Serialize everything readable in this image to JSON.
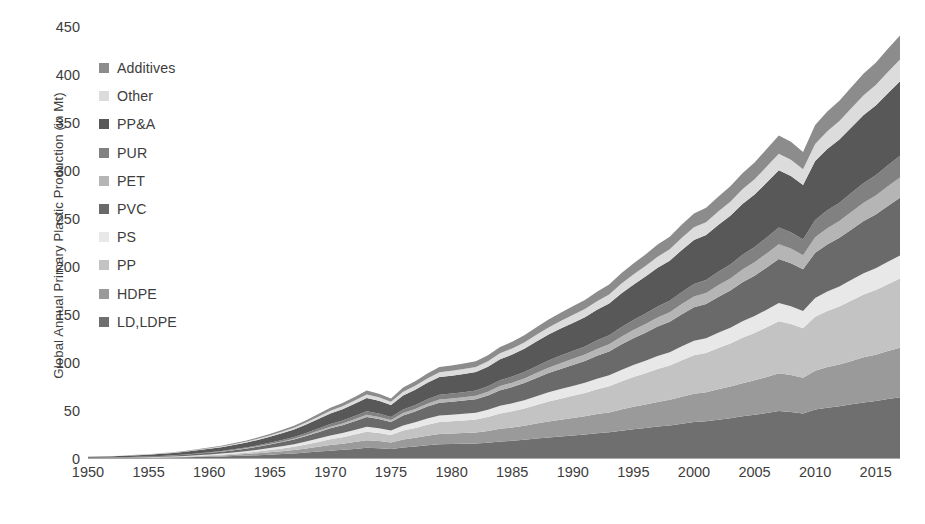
{
  "chart_data": {
    "type": "area",
    "stacked": true,
    "title": "",
    "xlabel": "",
    "ylabel": "Global Annual Primary Plastic Production (in Mt)",
    "ylim": [
      0,
      450
    ],
    "xlim": [
      1950,
      2017
    ],
    "y_ticks": [
      0,
      50,
      100,
      150,
      200,
      250,
      300,
      350,
      400,
      450
    ],
    "x_ticks": [
      1950,
      1955,
      1960,
      1965,
      1970,
      1975,
      1980,
      1985,
      1990,
      1995,
      2000,
      2005,
      2010,
      2015
    ],
    "grid": false,
    "legend_position": "inside-top-left",
    "x": [
      1950,
      1951,
      1952,
      1953,
      1954,
      1955,
      1956,
      1957,
      1958,
      1959,
      1960,
      1961,
      1962,
      1963,
      1964,
      1965,
      1966,
      1967,
      1968,
      1969,
      1970,
      1971,
      1972,
      1973,
      1974,
      1975,
      1976,
      1977,
      1978,
      1979,
      1980,
      1981,
      1982,
      1983,
      1984,
      1985,
      1986,
      1987,
      1988,
      1989,
      1990,
      1991,
      1992,
      1993,
      1994,
      1995,
      1996,
      1997,
      1998,
      1999,
      2000,
      2001,
      2002,
      2003,
      2004,
      2005,
      2006,
      2007,
      2008,
      2009,
      2010,
      2011,
      2012,
      2013,
      2014,
      2015,
      2016,
      2017
    ],
    "series": [
      {
        "name": "LD,LDPE",
        "color": "#6f6f6f",
        "stack_order": 1,
        "values": [
          0.3,
          0.4,
          0.4,
          0.5,
          0.6,
          0.7,
          0.9,
          1.0,
          1.2,
          1.5,
          1.8,
          2.1,
          2.5,
          2.9,
          3.4,
          4.0,
          4.6,
          5.3,
          6.2,
          7.2,
          8.2,
          9.0,
          10.0,
          11.1,
          10.6,
          9.8,
          11.5,
          12.5,
          13.8,
          14.8,
          15.0,
          15.3,
          15.6,
          16.5,
          17.8,
          18.5,
          19.5,
          20.8,
          22.0,
          23.0,
          24.0,
          25.0,
          26.3,
          27.3,
          29.0,
          30.5,
          31.8,
          33.3,
          34.5,
          36.3,
          38.0,
          38.8,
          40.5,
          42.0,
          44.0,
          45.5,
          47.5,
          49.5,
          48.5,
          47.0,
          51.0,
          53.0,
          54.5,
          56.5,
          58.5,
          60.0,
          62.0,
          64.0
        ]
      },
      {
        "name": "HDPE",
        "color": "#9a9a9a",
        "stack_order": 2,
        "values": [
          0.05,
          0.05,
          0.08,
          0.1,
          0.15,
          0.2,
          0.3,
          0.4,
          0.5,
          0.7,
          0.9,
          1.1,
          1.4,
          1.7,
          2.1,
          2.5,
          3.0,
          3.5,
          4.2,
          5.0,
          5.8,
          6.4,
          7.2,
          8.0,
          7.6,
          7.0,
          8.3,
          9.1,
          10.0,
          10.8,
          11.0,
          11.2,
          11.5,
          12.2,
          13.2,
          13.8,
          14.6,
          15.6,
          16.6,
          17.4,
          18.2,
          19.0,
          20.0,
          20.8,
          22.2,
          23.4,
          24.5,
          25.7,
          26.7,
          28.2,
          29.6,
          30.3,
          31.7,
          33.0,
          34.6,
          36.0,
          37.6,
          39.3,
          38.5,
          37.3,
          40.6,
          42.3,
          43.6,
          45.3,
          47.0,
          48.3,
          50.0,
          51.6
        ]
      },
      {
        "name": "PP",
        "color": "#c3c3c3",
        "stack_order": 3,
        "values": [
          0.0,
          0.0,
          0.0,
          0.0,
          0.02,
          0.05,
          0.1,
          0.2,
          0.3,
          0.45,
          0.6,
          0.8,
          1.1,
          1.4,
          1.8,
          2.3,
          2.8,
          3.4,
          4.2,
          5.1,
          6.0,
          6.8,
          7.8,
          8.8,
          8.4,
          7.8,
          9.3,
          10.3,
          11.5,
          12.5,
          12.8,
          13.2,
          13.6,
          14.6,
          16.0,
          16.9,
          18.0,
          19.4,
          20.8,
          22.0,
          23.2,
          24.4,
          25.9,
          27.2,
          29.2,
          31.0,
          32.6,
          34.4,
          35.8,
          38.0,
          40.0,
          41.0,
          43.1,
          45.0,
          47.4,
          49.4,
          51.8,
          54.3,
          53.2,
          51.5,
          56.2,
          58.6,
          60.5,
          63.0,
          65.5,
          67.4,
          69.8,
          72.0
        ]
      },
      {
        "name": "PS",
        "color": "#e8e8e8",
        "stack_order": 4,
        "values": [
          0.15,
          0.18,
          0.2,
          0.25,
          0.3,
          0.35,
          0.45,
          0.55,
          0.65,
          0.8,
          0.95,
          1.1,
          1.3,
          1.5,
          1.8,
          2.1,
          2.4,
          2.7,
          3.2,
          3.6,
          4.1,
          4.4,
          4.8,
          5.3,
          5.0,
          4.6,
          5.4,
          5.8,
          6.4,
          6.8,
          6.9,
          7.0,
          7.1,
          7.5,
          8.0,
          8.3,
          8.7,
          9.2,
          9.6,
          10.0,
          10.3,
          10.6,
          11.0,
          11.4,
          12.0,
          12.5,
          13.0,
          13.5,
          13.9,
          14.5,
          15.1,
          15.3,
          15.9,
          16.4,
          17.1,
          17.6,
          18.3,
          19.0,
          18.6,
          18.0,
          19.5,
          20.2,
          20.8,
          21.5,
          22.2,
          22.8,
          23.5,
          24.2
        ]
      },
      {
        "name": "PVC",
        "color": "#6a6a6a",
        "stack_order": 5,
        "values": [
          0.3,
          0.35,
          0.4,
          0.5,
          0.6,
          0.7,
          0.85,
          1.0,
          1.2,
          1.45,
          1.7,
          2.0,
          2.3,
          2.7,
          3.2,
          3.7,
          4.3,
          4.9,
          5.7,
          6.6,
          7.5,
          8.2,
          9.1,
          10.0,
          9.5,
          8.8,
          10.4,
          11.3,
          12.4,
          13.3,
          13.5,
          13.8,
          14.1,
          15.0,
          16.2,
          17.0,
          17.9,
          19.0,
          20.1,
          21.0,
          21.9,
          22.8,
          24.0,
          25.0,
          26.6,
          28.0,
          29.3,
          30.7,
          31.8,
          33.5,
          35.0,
          35.8,
          37.3,
          38.7,
          40.6,
          42.1,
          44.0,
          45.9,
          44.9,
          43.5,
          47.3,
          49.2,
          50.7,
          52.6,
          54.5,
          56.0,
          58.0,
          60.0
        ]
      },
      {
        "name": "PET",
        "color": "#b5b5b5",
        "stack_order": 6,
        "values": [
          0.0,
          0.0,
          0.0,
          0.0,
          0.0,
          0.01,
          0.02,
          0.04,
          0.06,
          0.1,
          0.15,
          0.2,
          0.28,
          0.36,
          0.46,
          0.6,
          0.75,
          0.9,
          1.1,
          1.35,
          1.6,
          1.8,
          2.05,
          2.3,
          2.2,
          2.05,
          2.45,
          2.7,
          3.0,
          3.3,
          3.4,
          3.5,
          3.6,
          3.9,
          4.3,
          4.5,
          4.8,
          5.2,
          5.6,
          6.0,
          6.3,
          6.6,
          7.0,
          7.4,
          8.0,
          8.5,
          9.0,
          9.5,
          9.9,
          10.6,
          11.2,
          11.5,
          12.1,
          12.7,
          13.4,
          14.0,
          14.7,
          15.5,
          15.2,
          14.7,
          16.1,
          16.9,
          17.5,
          18.3,
          19.0,
          19.7,
          20.5,
          21.2
        ]
      },
      {
        "name": "PUR",
        "color": "#818181",
        "stack_order": 7,
        "values": [
          0.0,
          0.0,
          0.01,
          0.02,
          0.04,
          0.06,
          0.1,
          0.15,
          0.2,
          0.3,
          0.4,
          0.5,
          0.65,
          0.8,
          1.0,
          1.2,
          1.45,
          1.7,
          2.0,
          2.35,
          2.7,
          2.95,
          3.3,
          3.65,
          3.5,
          3.25,
          3.85,
          4.2,
          4.6,
          5.0,
          5.1,
          5.2,
          5.3,
          5.6,
          6.1,
          6.4,
          6.7,
          7.1,
          7.5,
          7.9,
          8.2,
          8.5,
          9.0,
          9.4,
          10.0,
          10.5,
          11.0,
          11.5,
          11.9,
          12.6,
          13.2,
          13.5,
          14.1,
          14.6,
          15.3,
          15.9,
          16.6,
          17.3,
          17.0,
          16.4,
          17.9,
          18.6,
          19.2,
          20.0,
          20.7,
          21.3,
          22.1,
          22.8
        ]
      },
      {
        "name": "PP&A",
        "color": "#585858",
        "stack_order": 8,
        "values": [
          1.1,
          1.2,
          1.3,
          1.5,
          1.7,
          1.9,
          2.2,
          2.5,
          2.8,
          3.2,
          3.6,
          4.0,
          4.5,
          5.0,
          5.6,
          6.3,
          7.0,
          7.8,
          8.8,
          9.9,
          11.0,
          11.9,
          12.9,
          14.0,
          13.4,
          12.5,
          14.6,
          15.8,
          17.2,
          18.4,
          18.7,
          19.0,
          19.4,
          20.5,
          22.0,
          23.0,
          24.2,
          25.6,
          27.0,
          28.2,
          29.3,
          30.4,
          31.9,
          33.2,
          35.2,
          36.9,
          38.5,
          40.3,
          41.7,
          43.8,
          45.8,
          46.8,
          48.8,
          50.7,
          53.0,
          54.9,
          57.3,
          59.8,
          58.6,
          56.8,
          61.6,
          64.0,
          65.9,
          68.3,
          70.7,
          72.6,
          75.1,
          77.6
        ]
      },
      {
        "name": "Other",
        "color": "#dcdcdc",
        "stack_order": 9,
        "values": [
          0.1,
          0.12,
          0.14,
          0.17,
          0.2,
          0.24,
          0.3,
          0.35,
          0.42,
          0.52,
          0.62,
          0.72,
          0.85,
          1.0,
          1.2,
          1.4,
          1.6,
          1.85,
          2.15,
          2.5,
          2.85,
          3.1,
          3.4,
          3.7,
          3.55,
          3.3,
          3.9,
          4.2,
          4.6,
          5.0,
          5.1,
          5.2,
          5.3,
          5.6,
          6.1,
          6.4,
          6.7,
          7.1,
          7.5,
          7.9,
          8.2,
          8.5,
          9.0,
          9.4,
          10.0,
          10.5,
          11.0,
          11.5,
          11.9,
          12.6,
          13.2,
          13.5,
          14.1,
          14.6,
          15.3,
          15.9,
          16.6,
          17.3,
          17.0,
          16.4,
          17.9,
          18.6,
          19.2,
          20.0,
          20.7,
          21.3,
          22.1,
          22.8
        ]
      },
      {
        "name": "Additives",
        "color": "#8c8c8c",
        "stack_order": 10,
        "values": [
          0.1,
          0.12,
          0.14,
          0.17,
          0.2,
          0.25,
          0.3,
          0.38,
          0.46,
          0.57,
          0.68,
          0.8,
          0.95,
          1.1,
          1.3,
          1.5,
          1.75,
          2.0,
          2.35,
          2.7,
          3.1,
          3.4,
          3.7,
          4.1,
          3.9,
          3.6,
          4.3,
          4.7,
          5.1,
          5.5,
          5.6,
          5.7,
          5.8,
          6.2,
          6.7,
          7.0,
          7.4,
          7.9,
          8.3,
          8.7,
          9.1,
          9.4,
          9.9,
          10.3,
          11.0,
          11.5,
          12.1,
          12.7,
          13.1,
          13.9,
          14.5,
          14.9,
          15.5,
          16.1,
          16.9,
          17.5,
          18.3,
          19.0,
          18.7,
          18.0,
          19.7,
          20.5,
          21.1,
          21.9,
          22.7,
          23.4,
          24.2,
          25.0
        ]
      }
    ]
  },
  "legend": {
    "items": [
      {
        "label": "Additives",
        "color": "#8c8c8c"
      },
      {
        "label": "Other",
        "color": "#dcdcdc"
      },
      {
        "label": "PP&A",
        "color": "#585858"
      },
      {
        "label": "PUR",
        "color": "#818181"
      },
      {
        "label": "PET",
        "color": "#b5b5b5"
      },
      {
        "label": "PVC",
        "color": "#6a6a6a"
      },
      {
        "label": "PS",
        "color": "#e8e8e8"
      },
      {
        "label": "PP",
        "color": "#c3c3c3"
      },
      {
        "label": "HDPE",
        "color": "#9a9a9a"
      },
      {
        "label": "LD,LDPE",
        "color": "#6f6f6f"
      }
    ]
  },
  "axis": {
    "y_title": "Global Annual Primary Plastic Production (in Mt)",
    "y_tick_labels": [
      "450",
      "400",
      "350",
      "300",
      "250",
      "200",
      "150",
      "100",
      "50",
      "0"
    ],
    "x_tick_labels": [
      "1950",
      "1955",
      "1960",
      "1965",
      "1970",
      "1975",
      "1980",
      "1985",
      "1990",
      "1995",
      "2000",
      "2005",
      "2010",
      "2015"
    ]
  }
}
